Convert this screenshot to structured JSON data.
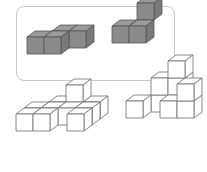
{
  "colors": {
    "frame_border": "#c8c8c8",
    "solid_top": "#9a9a9a",
    "solid_front": "#8a8a8a",
    "solid_side": "#7a7a7a",
    "solid_edge": "#555555",
    "wire_fill": "#ffffff",
    "wire_edge": "#7a7a7a"
  },
  "cube": {
    "size": 17,
    "depth_dx": 8,
    "depth_dy": 6
  },
  "shapes": [
    {
      "name": "solid-z-shape",
      "style": "solid",
      "origin": [
        27,
        37
      ],
      "cubes": [
        [
          1,
          0,
          1
        ],
        [
          2,
          0,
          1
        ],
        [
          0,
          0,
          0
        ],
        [
          1,
          0,
          0
        ]
      ]
    },
    {
      "name": "solid-tripod-shape",
      "style": "solid",
      "origin": [
        112,
        26
      ],
      "cubes": [
        [
          1,
          1,
          1
        ],
        [
          0,
          0,
          0
        ],
        [
          1,
          0,
          0
        ]
      ],
      "note_cubes": "x, y(height), z(depth: 1 = back)"
    },
    {
      "name": "wire-shape-a",
      "style": "wire",
      "origin": [
        16,
        114
      ],
      "cubes": [
        [
          1,
          0,
          2
        ],
        [
          2,
          0,
          2
        ],
        [
          3,
          0,
          2
        ],
        [
          0,
          0,
          1
        ],
        [
          1,
          0,
          1
        ],
        [
          2,
          0,
          1
        ],
        [
          3,
          0,
          1
        ],
        [
          2,
          1,
          2
        ],
        [
          0,
          0,
          0
        ],
        [
          1,
          0,
          0
        ],
        [
          3,
          0,
          0
        ]
      ]
    },
    {
      "name": "wire-shape-b",
      "style": "wire",
      "origin": [
        126,
        101
      ],
      "cubes": [
        [
          2,
          2,
          1
        ],
        [
          1,
          1,
          1
        ],
        [
          2,
          1,
          1
        ],
        [
          2,
          0,
          1
        ],
        [
          1,
          0,
          1
        ],
        [
          3,
          1,
          0
        ],
        [
          3,
          0,
          0
        ],
        [
          2,
          0,
          0
        ],
        [
          0,
          0,
          0
        ]
      ]
    }
  ]
}
